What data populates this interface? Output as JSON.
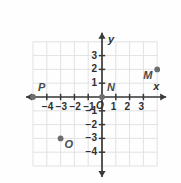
{
  "figure": {
    "kind": "coordinate-plane",
    "axis_labels": {
      "x": "x",
      "y": "y"
    },
    "origin_label": "O"
  },
  "chart_data": {
    "type": "scatter",
    "title": "",
    "xlabel": "x",
    "ylabel": "y",
    "xlim": [
      -5,
      4
    ],
    "ylim": [
      -5,
      4
    ],
    "grid": true,
    "legend": "none",
    "xticks": [
      -4,
      -3,
      -2,
      -1,
      1,
      2,
      3
    ],
    "yticks": [
      3,
      2,
      1,
      -1,
      -2,
      -3,
      -4
    ],
    "xtick_labels": [
      "−4",
      "−3",
      "−2",
      "−1",
      "1",
      "2",
      "3"
    ],
    "ytick_labels": [
      "3",
      "2",
      "1",
      "−1",
      "−2",
      "−3",
      "−4"
    ],
    "points": [
      {
        "label": "P",
        "x": -5,
        "y": 0,
        "label_pos": "upper-right"
      },
      {
        "label": "N",
        "x": 0,
        "y": 0,
        "label_pos": "upper-right"
      },
      {
        "label": "M",
        "x": 4,
        "y": 2,
        "label_pos": "lower-left"
      },
      {
        "label": "O",
        "x": -3,
        "y": -3,
        "label_pos": "lower-right"
      }
    ]
  },
  "colors": {
    "grid": "#e2e2e2",
    "axis": "#3a3a3a",
    "point": "#6e6e6e",
    "text": "#2f2f2f",
    "background": "#ffffff"
  }
}
